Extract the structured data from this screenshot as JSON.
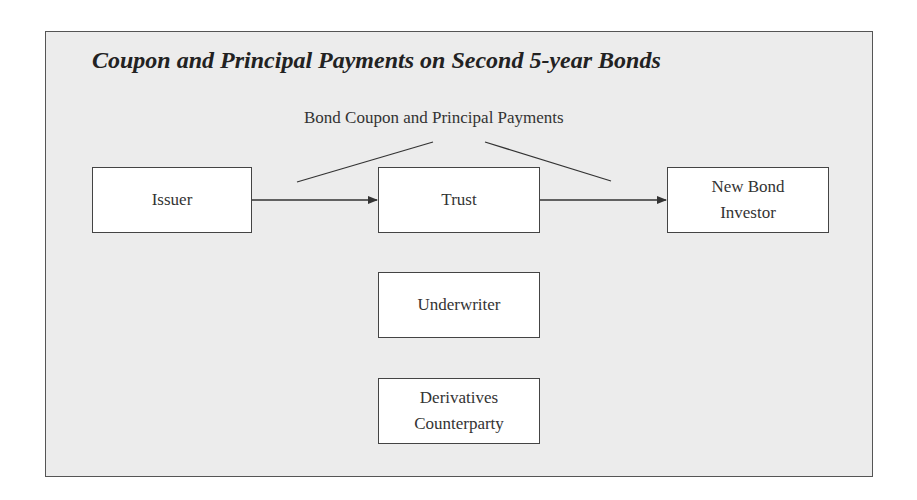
{
  "diagram": {
    "title": "Coupon and Principal Payments on Second 5-year Bonds",
    "flow_label": "Bond Coupon and Principal Payments",
    "nodes": {
      "issuer": "Issuer",
      "trust": "Trust",
      "investor_line1": "New Bond",
      "investor_line2": "Investor",
      "underwriter": "Underwriter",
      "derivatives_line1": "Derivatives",
      "derivatives_line2": "Counterparty"
    },
    "edges": [
      {
        "from": "Issuer",
        "to": "Trust"
      },
      {
        "from": "Trust",
        "to": "New Bond Investor"
      }
    ],
    "colors": {
      "background": "#ececec",
      "box_fill": "#ffffff",
      "stroke": "#444444"
    }
  }
}
